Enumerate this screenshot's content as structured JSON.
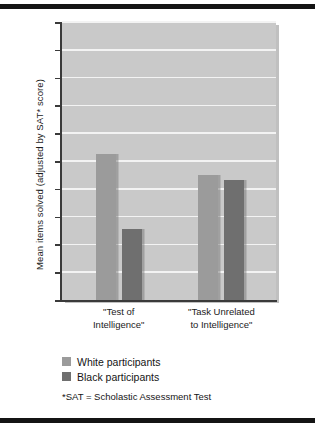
{
  "chart_data": {
    "type": "bar",
    "title": "",
    "xlabel": "",
    "ylabel": "Mean items solved (adjusted by SAT* score)",
    "ylim": [
      0,
      20
    ],
    "ytick_step": 2,
    "yticks": [
      20,
      18,
      16,
      14,
      12,
      10,
      8,
      6,
      4,
      2,
      0
    ],
    "grid": true,
    "legend_position": "below-axes-left",
    "categories": [
      "\"Test of Intelligence\"",
      "\"Task Unrelated to Intelligence\""
    ],
    "category_lines": [
      [
        "\"Test of",
        "Intelligence\""
      ],
      [
        "\"Task Unrelated",
        "to Intelligence\""
      ]
    ],
    "series": [
      {
        "name": "White participants",
        "color": "#9b9b9b",
        "values": [
          10.5,
          9.0
        ]
      },
      {
        "name": "Black participants",
        "color": "#6f6f6f",
        "values": [
          5.1,
          8.65
        ]
      }
    ],
    "footnote": "*SAT = Scholastic Assessment Test"
  },
  "colors": {
    "plot_background": "#c9c9c9",
    "gridline": "#f3f3f3",
    "axis": "#3a3a3a",
    "rule": "#141414",
    "bar_light": "#9b9b9b",
    "bar_dark": "#6f6f6f"
  }
}
